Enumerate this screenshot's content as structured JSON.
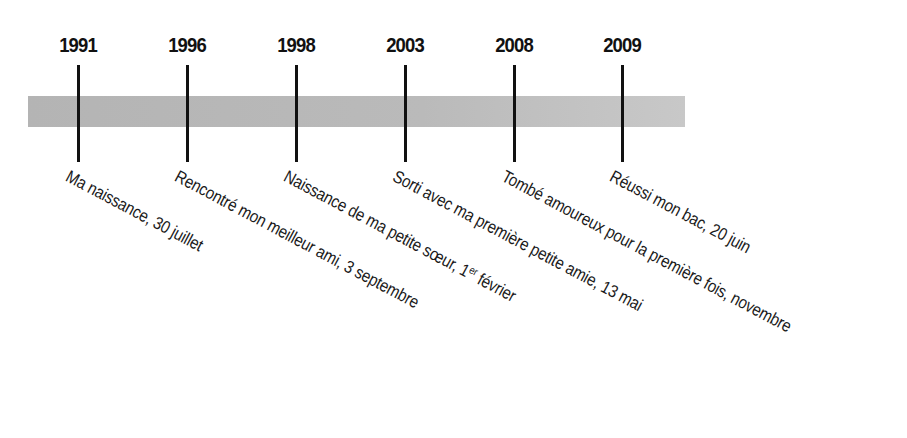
{
  "timeline": {
    "bar_color": "#b8b8b8",
    "tick_color": "#111111",
    "events": [
      {
        "year": "1991",
        "x": 78,
        "label": "Ma naissance, 30 juillet"
      },
      {
        "year": "1996",
        "x": 187,
        "label": "Rencontré mon meilleur ami, 3 septembre"
      },
      {
        "year": "1998",
        "x": 296,
        "label_pre": "Naissance de ma petite sœur, 1",
        "label_sup": "er",
        "label_post": " février"
      },
      {
        "year": "2003",
        "x": 405,
        "label": "Sorti avec ma première petite amie, 13 mai"
      },
      {
        "year": "2008",
        "x": 514,
        "label": "Tombé amoureux pour la première fois, novembre"
      },
      {
        "year": "2009",
        "x": 622,
        "label": "Réussi mon bac, 20 juin"
      }
    ]
  }
}
